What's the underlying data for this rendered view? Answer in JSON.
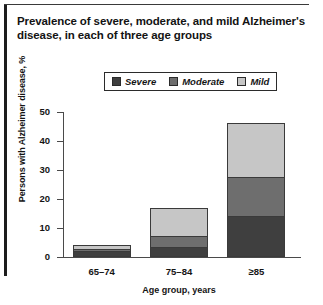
{
  "figure": {
    "title": "Prevalence of severe, moderate, and mild Alzheimer's disease, in each of three age groups"
  },
  "chart_data": {
    "type": "bar",
    "stacked": true,
    "title": "Prevalence of severe, moderate, and mild Alzheimer's disease, in each of three age groups",
    "xlabel": "Age group, years",
    "ylabel": "Persons with Alzheimer disease, %",
    "categories": [
      "65–74",
      "75–84",
      "≥85"
    ],
    "ylim": [
      0,
      50
    ],
    "yticks": [
      0,
      10,
      20,
      30,
      40,
      50
    ],
    "ytick_labels": [
      "0",
      "10",
      "20",
      "30",
      "40",
      "50"
    ],
    "grid": false,
    "legend_position": "top-center",
    "series": [
      {
        "name": "Severe",
        "color": "#3f3f3f",
        "values": [
          2.0,
          3.5,
          14.0
        ]
      },
      {
        "name": "Moderate",
        "color": "#6e6e6e",
        "values": [
          1.0,
          4.0,
          14.0
        ]
      },
      {
        "name": "Mild",
        "color": "#c6c6c6",
        "values": [
          2.0,
          10.0,
          19.0
        ]
      }
    ],
    "totals": [
      5.0,
      17.5,
      47.0
    ]
  },
  "legend": {
    "items": [
      {
        "label": "Severe",
        "swatch": "#3f3f3f"
      },
      {
        "label": "Moderate",
        "swatch": "#6e6e6e"
      },
      {
        "label": "Mild",
        "swatch": "#c6c6c6"
      }
    ]
  },
  "axes": {
    "x_title": "Age group, years",
    "y_title": "Persons with Alzheimer disease, %",
    "y_ticks": [
      "50",
      "40",
      "30",
      "20",
      "10",
      "0"
    ],
    "x_ticks": [
      "65–74",
      "75–84",
      "≥85"
    ]
  }
}
